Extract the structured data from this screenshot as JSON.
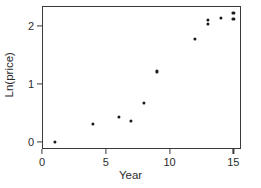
{
  "chart_data": {
    "type": "scatter",
    "title": "",
    "xlabel": "Year",
    "ylabel": "Ln(price)",
    "xlim": [
      0,
      15.6
    ],
    "ylim": [
      -0.12,
      2.35
    ],
    "xticks": [
      0,
      5,
      10,
      15
    ],
    "xticklabels": [
      "0",
      "5",
      "10",
      "15"
    ],
    "yticks": [
      0,
      1,
      2
    ],
    "yticklabels": [
      "0",
      "1",
      "2"
    ],
    "grid": false,
    "legend": false,
    "marker_color": "#1a1a1a",
    "frame_color": "#3a3a3a",
    "background_color": "#ffffff",
    "x": [
      1,
      4,
      6,
      7,
      8,
      9,
      12,
      13,
      13,
      14,
      15,
      15
    ],
    "y": [
      0.0,
      0.32,
      0.44,
      0.37,
      0.68,
      1.22,
      1.78,
      2.04,
      2.11,
      2.15,
      2.13,
      2.23
    ],
    "points": [
      {
        "x": 1,
        "y": 0.0
      },
      {
        "x": 4,
        "y": 0.32
      },
      {
        "x": 6,
        "y": 0.44
      },
      {
        "x": 7,
        "y": 0.37
      },
      {
        "x": 8,
        "y": 0.68
      },
      {
        "x": 9,
        "y": 1.22
      },
      {
        "x": 12,
        "y": 1.78
      },
      {
        "x": 13,
        "y": 2.04
      },
      {
        "x": 13,
        "y": 2.11
      },
      {
        "x": 14,
        "y": 2.15
      },
      {
        "x": 15,
        "y": 2.13
      },
      {
        "x": 15,
        "y": 2.23
      }
    ]
  }
}
